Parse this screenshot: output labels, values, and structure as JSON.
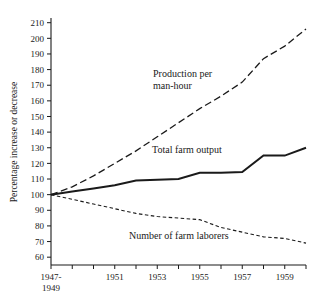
{
  "chart_data": {
    "type": "line",
    "title": "",
    "xlabel": "",
    "ylabel": "Percentage increase or decrease",
    "xlim": [
      1948,
      1960
    ],
    "ylim": [
      55,
      213
    ],
    "grid": false,
    "legend_position": "inline-annotations",
    "x_tick_labels": [
      "1947-\n1949",
      "1951",
      "1953",
      "1955",
      "1957",
      "1959"
    ],
    "x_tick_values": [
      1948,
      1951,
      1953,
      1955,
      1957,
      1959
    ],
    "x_minor_tick_values": [
      1949,
      1950,
      1952,
      1954,
      1956,
      1958,
      1960
    ],
    "y_ticks": [
      60,
      70,
      80,
      90,
      100,
      110,
      120,
      130,
      140,
      150,
      160,
      170,
      180,
      190,
      200,
      210
    ],
    "x": [
      1948,
      1949,
      1950,
      1951,
      1952,
      1953,
      1954,
      1955,
      1956,
      1957,
      1958,
      1959,
      1960
    ],
    "series": [
      {
        "name": "Production per man-hour",
        "style": "long-dashed",
        "values": [
          100,
          105,
          112,
          120,
          128,
          137,
          146,
          155,
          163,
          172,
          187,
          195,
          206
        ]
      },
      {
        "name": "Total farm output",
        "style": "solid",
        "values": [
          100,
          102,
          104,
          106,
          109,
          109.5,
          110,
          114,
          114,
          114.5,
          125,
          125,
          130
        ]
      },
      {
        "name": "Number of farm laborers",
        "style": "short-dashed",
        "values": [
          100,
          97,
          94,
          91,
          88,
          86,
          85,
          84,
          79,
          76,
          73,
          72,
          69
        ]
      }
    ],
    "annotations": [
      {
        "id": "annotation-production",
        "lines": [
          "Production per",
          "man-hour"
        ],
        "x_px": 153,
        "y_px": 77
      },
      {
        "id": "annotation-output",
        "lines": [
          "Total farm output"
        ],
        "x_px": 152,
        "y_px": 153
      },
      {
        "id": "annotation-laborers",
        "lines": [
          "Number of farm laborers"
        ],
        "x_px": 129,
        "y_px": 239
      }
    ]
  },
  "y_axis": {
    "label": "Percentage increase or decrease",
    "tick_labels": [
      "210",
      "200",
      "190",
      "180",
      "170",
      "160",
      "150",
      "140",
      "130",
      "120",
      "110",
      "100",
      "90",
      "80",
      "70",
      "60"
    ]
  },
  "x_axis": {
    "tick_labels": [
      {
        "line1": "1947-",
        "line2": "1949"
      },
      {
        "line1": "1951",
        "line2": ""
      },
      {
        "line1": "1953",
        "line2": ""
      },
      {
        "line1": "1955",
        "line2": ""
      },
      {
        "line1": "1957",
        "line2": ""
      },
      {
        "line1": "1959",
        "line2": ""
      }
    ]
  },
  "annotations": {
    "production_line1": "Production per",
    "production_line2": "man-hour",
    "output": "Total farm output",
    "laborers": "Number of farm laborers"
  },
  "colors": {
    "ink": "#1a1a1a",
    "background": "#ffffff"
  }
}
